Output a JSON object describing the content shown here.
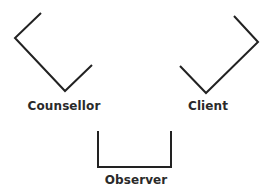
{
  "diagram": {
    "type": "seating-arrangement",
    "line_color": "#222222",
    "nodes": [
      {
        "id": "counsellor",
        "label": "Counsellor",
        "shape_points": "41,13 15,38 65,91 92,65",
        "label_x": 64,
        "label_y": 99
      },
      {
        "id": "client",
        "label": "Client",
        "shape_points": "234,16 258,42 206,93 180,66",
        "label_x": 208,
        "label_y": 99
      },
      {
        "id": "observer",
        "label": "Observer",
        "shape_points": "98,131 98,167 171,167 171,131",
        "label_x": 136,
        "label_y": 173
      }
    ]
  }
}
